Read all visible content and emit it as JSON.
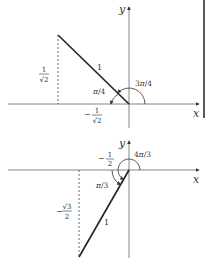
{
  "diagrams": [
    {
      "id": "top",
      "axis_x_label": "x",
      "axis_y_label": "y",
      "hypotenuse_label": "1",
      "reference_angle_label": "π/4",
      "angle_label": "3π/4",
      "x_coord_label": {
        "sign": "−",
        "num": "1",
        "den": "√2"
      },
      "y_coord_label": {
        "sign": "",
        "num": "1",
        "den": "√2"
      }
    },
    {
      "id": "bottom",
      "axis_x_label": "x",
      "axis_y_label": "y",
      "hypotenuse_label": "1",
      "reference_angle_label": "π/3",
      "angle_label": "4π/3",
      "x_coord_label": {
        "sign": "−",
        "num": "1",
        "den": "2"
      },
      "y_coord_label": {
        "sign": "−",
        "num": "√3",
        "den": "2"
      }
    }
  ],
  "colors": {
    "line": "#222222",
    "axis": "#555555",
    "text": "#333333"
  }
}
